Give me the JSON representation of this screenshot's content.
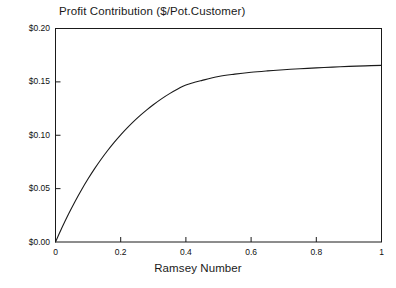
{
  "chart_data": {
    "type": "line",
    "title": "Profit Contribution ($/Pot.Customer)",
    "xlabel": "Ramsey Number",
    "ylabel": "",
    "xlim": [
      0,
      1
    ],
    "ylim": [
      0,
      0.2
    ],
    "grid": false,
    "legend": null,
    "xticks": [
      0,
      0.2,
      0.4,
      0.6,
      0.8,
      1
    ],
    "xtick_labels": [
      "0",
      "0.2",
      "0.4",
      "0.6",
      "0.8",
      "1"
    ],
    "yticks": [
      0,
      0.05,
      0.1,
      0.15,
      0.2
    ],
    "ytick_labels": [
      "$0.00",
      "$0.05",
      "$0.10",
      "$0.15",
      "$0.20"
    ],
    "series": [
      {
        "name": "Profit Contribution",
        "color": "#1a1a1a",
        "x": [
          0,
          0.02,
          0.04,
          0.06,
          0.08,
          0.1,
          0.12,
          0.14,
          0.16,
          0.18,
          0.2,
          0.22,
          0.24,
          0.26,
          0.28,
          0.3,
          0.325,
          0.35,
          0.375,
          0.4,
          0.45,
          0.5,
          0.55,
          0.6,
          0.65,
          0.7,
          0.75,
          0.8,
          0.85,
          0.9,
          0.95,
          1.0
        ],
        "y": [
          0.0,
          0.0135,
          0.0262,
          0.038,
          0.049,
          0.0592,
          0.0687,
          0.0775,
          0.0857,
          0.0933,
          0.1004,
          0.1069,
          0.113,
          0.1186,
          0.1238,
          0.1286,
          0.1341,
          0.139,
          0.1433,
          0.1471,
          0.1514,
          0.1551,
          0.1573,
          0.159,
          0.1603,
          0.1614,
          0.1623,
          0.1631,
          0.1638,
          0.1645,
          0.165,
          0.1655
        ]
      }
    ]
  },
  "axes": {
    "frame_color": "#1a1a1a"
  }
}
